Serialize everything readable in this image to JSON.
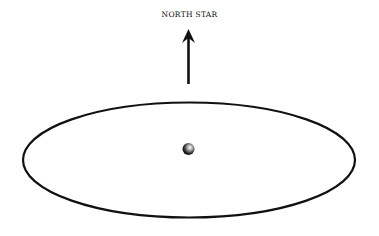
{
  "diagram": {
    "label": "NORTH STAR",
    "arrow_direction": "up",
    "elements": [
      "north-star-label",
      "direction-arrow",
      "orbit-ellipse",
      "central-sphere"
    ],
    "colors": {
      "stroke": "#111111",
      "background": "#ffffff"
    }
  }
}
